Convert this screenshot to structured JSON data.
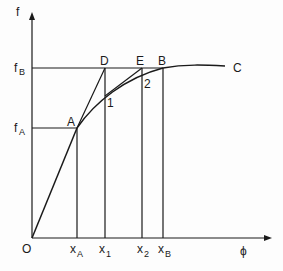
{
  "diagram": {
    "axes": {
      "y_label": "f",
      "x_label": "ϕ",
      "origin_label": "O"
    },
    "y_ticks": [
      {
        "main": "f",
        "sub": "B"
      },
      {
        "main": "f",
        "sub": "A"
      }
    ],
    "x_ticks": [
      {
        "main": "x",
        "sub": "A"
      },
      {
        "main": "x",
        "sub": "1"
      },
      {
        "main": "x",
        "sub": "2"
      },
      {
        "main": "x",
        "sub": "B"
      }
    ],
    "points": {
      "A": "A",
      "B": "B",
      "C": "C",
      "D": "D",
      "E": "E",
      "p1": "1",
      "p2": "2"
    },
    "colors": {
      "ink": "#1a1a1a",
      "paper": "#fdfdfd"
    }
  }
}
